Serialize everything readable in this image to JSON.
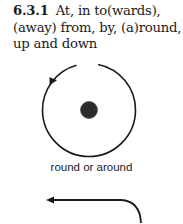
{
  "section": {
    "number": "6.3.1",
    "title": "At, in to(wards), (away) from, by, (a)round, up and down"
  },
  "figures": [
    {
      "type": "circle-with-arrow",
      "caption": "round or around",
      "icon": "circular-arrow-around-dot"
    },
    {
      "type": "curved-arrow",
      "icon": "curved-left-arrow"
    }
  ],
  "colors": {
    "ink": "#1a1a1a",
    "dot": "#2b2b2b"
  }
}
